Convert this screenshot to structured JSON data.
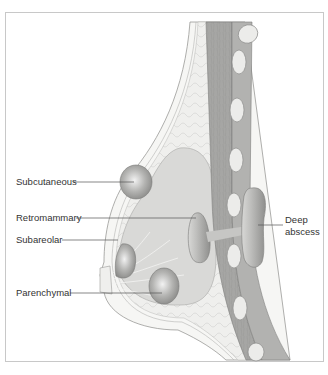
{
  "diagram": {
    "labels": {
      "subcutaneous": "Subcutaneous",
      "retromammary": "Retromammary",
      "subareolar": "Subareolar",
      "parenchymal": "Parenchymal",
      "deep_abscess_line1": "Deep",
      "deep_abscess_line2": "abscess"
    },
    "colors": {
      "frame": "#c8c8c8",
      "skin": "#f4f4f2",
      "fat": "#ececea",
      "gland": "#d8d8d6",
      "muscle": "#a8a8a6",
      "rib": "#e8e8e4",
      "abscess": "#9a9a98",
      "leader_line": "#555555"
    }
  }
}
